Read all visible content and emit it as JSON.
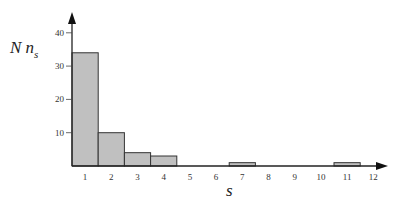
{
  "chart_data": {
    "type": "bar",
    "title": "",
    "xlabel": "s",
    "ylabel": "N n_s",
    "ylabel_parts": {
      "main": "N n",
      "sub": "s"
    },
    "categories": [
      "1",
      "2",
      "3",
      "4",
      "5",
      "6",
      "7",
      "8",
      "9",
      "10",
      "11",
      "12"
    ],
    "values": [
      34,
      10,
      4,
      3,
      0,
      0,
      1,
      0,
      0,
      0,
      1,
      0
    ],
    "yticks": [
      10,
      20,
      30,
      40
    ],
    "ylim": [
      0,
      45
    ],
    "grid": false,
    "legend": null,
    "colors": {
      "bar_fill": "#c0c0c0",
      "bar_stroke": "#333333",
      "axis": "#222222"
    }
  }
}
